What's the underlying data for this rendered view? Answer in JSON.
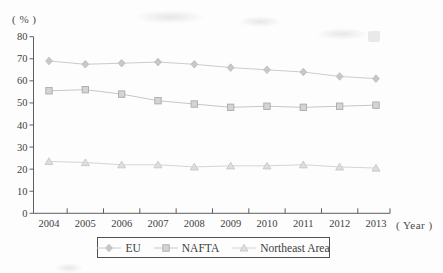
{
  "figure": {
    "y_unit_label": "( % )",
    "x_unit_label": "( Year )"
  },
  "chart_data": {
    "type": "line",
    "title": "",
    "xlabel": "Year",
    "ylabel": "%",
    "categories": [
      "2004",
      "2005",
      "2006",
      "2007",
      "2008",
      "2009",
      "2010",
      "2011",
      "2012",
      "2013"
    ],
    "y_ticks": [
      0,
      10,
      20,
      30,
      40,
      50,
      60,
      70,
      80
    ],
    "ylim": [
      0,
      80
    ],
    "grid": false,
    "legend_position": "bottom",
    "axis_color": "#5f5f5f",
    "text_color": "#3f3f3f",
    "series": [
      {
        "name": "EU",
        "marker": "diamond",
        "line_color": "#cccccc",
        "marker_fill": "#c8c8c8",
        "marker_stroke": "#b9b9b9",
        "values": [
          69,
          67.5,
          68,
          68.5,
          67.5,
          66,
          65,
          64,
          62,
          61
        ]
      },
      {
        "name": "NAFTA",
        "marker": "square",
        "line_color": "#c7c7c7",
        "marker_fill": "#d4d4d4",
        "marker_stroke": "#aaaaaa",
        "values": [
          55.5,
          56,
          54,
          51,
          49.5,
          48,
          48.5,
          48,
          48.5,
          49
        ]
      },
      {
        "name": "Northeast Area",
        "marker": "triangle",
        "line_color": "#d5d5d5",
        "marker_fill": "#dedede",
        "marker_stroke": "#c3c3c3",
        "values": [
          23.5,
          23,
          22,
          22,
          21,
          21.5,
          21.5,
          22,
          21,
          20.5
        ]
      }
    ]
  }
}
